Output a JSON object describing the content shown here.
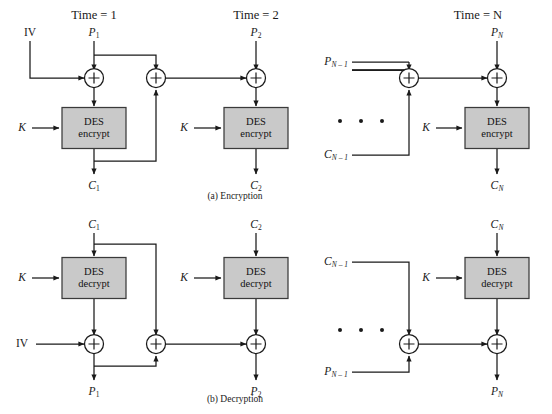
{
  "figure": {
    "panels": [
      {
        "caption": "(a) Encryption",
        "operation": "encrypt"
      },
      {
        "caption": "(b) Decryption",
        "operation": "decrypt"
      }
    ]
  },
  "time_labels": {
    "t1": "Time = 1",
    "t2": "Time = 2",
    "tn": "Time = N"
  },
  "encryption": {
    "iv_label": "IV",
    "key_labels": [
      "K",
      "K",
      "K"
    ],
    "cipher_block_label_line1": "DES",
    "cipher_block_label_line2": "encrypt",
    "inputs": [
      {
        "base": "P",
        "sub": "1"
      },
      {
        "base": "P",
        "sub": "2"
      },
      {
        "base": "P",
        "sub": "N"
      }
    ],
    "outputs": [
      {
        "base": "C",
        "sub": "1"
      },
      {
        "base": "C",
        "sub": "2"
      },
      {
        "base": "C",
        "sub": "N"
      }
    ],
    "tail_inputs": [
      {
        "base": "P",
        "sub": "N – 1"
      },
      {
        "base": "C",
        "sub": "N – 1"
      }
    ],
    "xor_symbol": "⊕",
    "ellipsis_count": 3
  },
  "decryption": {
    "iv_label": "IV",
    "key_labels": [
      "K",
      "K",
      "K"
    ],
    "cipher_block_label_line1": "DES",
    "cipher_block_label_line2": "decrypt",
    "inputs": [
      {
        "base": "C",
        "sub": "1"
      },
      {
        "base": "C",
        "sub": "2"
      },
      {
        "base": "C",
        "sub": "N"
      }
    ],
    "outputs": [
      {
        "base": "P",
        "sub": "1"
      },
      {
        "base": "P",
        "sub": "2"
      },
      {
        "base": "P",
        "sub": "N"
      }
    ],
    "tail_inputs": [
      {
        "base": "C",
        "sub": "N – 1"
      },
      {
        "base": "P",
        "sub": "N – 1"
      }
    ],
    "xor_symbol": "⊕",
    "ellipsis_count": 3
  },
  "colors": {
    "line": "#1a1a1a",
    "block_fill": "#c9c9c9",
    "block_stroke": "#3a3a3a",
    "background": "#ffffff",
    "text": "#1a1a1a"
  }
}
